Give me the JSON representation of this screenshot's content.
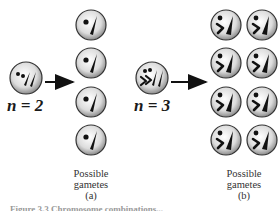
{
  "panel_a": {
    "parent_label": "n = 2",
    "caption_line1": "Possible",
    "caption_line2": "gametes",
    "caption_tag": "(a)",
    "gamete_count": 4
  },
  "panel_b": {
    "parent_label": "n = 3",
    "caption_line1": "Possible",
    "caption_line2": "gametes",
    "caption_tag": "(b)",
    "gamete_count": 8
  },
  "figure_caption": "Figure 3.3 Chromosome combinations..."
}
